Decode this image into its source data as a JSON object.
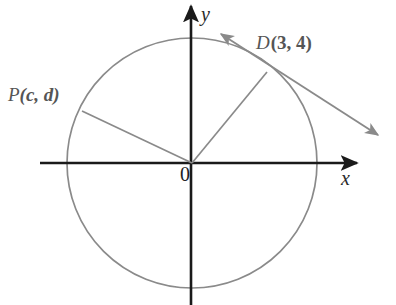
{
  "figure": {
    "kind": "unit-circle-tangent-diagram",
    "canvas": {
      "width": 396,
      "height": 305,
      "background": "#ffffff"
    },
    "colors": {
      "axis": "#1a1a1a",
      "circle": "#8a8a8a",
      "radius": "#8a8a8a",
      "tangent": "#8a8a8a",
      "label": "#555555",
      "axis_label": "#2a2a2a",
      "origin_label": "#1e1e1e"
    },
    "axes": {
      "x_label": "x",
      "y_label": "y",
      "origin_label": "0",
      "x_axis": {
        "x1": 40,
        "y1": 163,
        "x2": 360,
        "y2": 163,
        "arrow": "right"
      },
      "y_axis": {
        "x1": 191,
        "y1": 3,
        "x2": 191,
        "y2": 305,
        "arrow": "up"
      }
    },
    "circle": {
      "cx": 192,
      "cy": 163,
      "r": 125
    },
    "points": [
      {
        "id": "D",
        "name": "D",
        "coords_text": "(3, 4)",
        "full_label": "D (3, 4)",
        "x": 267,
        "y": 72,
        "quadrant": 1
      },
      {
        "id": "P",
        "name": "P",
        "coords_text": "(c, d)",
        "full_label": "P(c, d)",
        "x": 82,
        "y": 111,
        "quadrant": 2
      }
    ],
    "radii": [
      {
        "id": "radius-to-d",
        "x1": 192,
        "y1": 163,
        "x2": 267,
        "y2": 72
      },
      {
        "id": "radius-to-p",
        "x1": 192,
        "y1": 163,
        "x2": 82,
        "y2": 111
      }
    ],
    "tangent_line": {
      "id": "tangent-at-d",
      "x1": 218,
      "y1": 32,
      "x2": 382,
      "y2": 138,
      "arrows": "both"
    }
  }
}
